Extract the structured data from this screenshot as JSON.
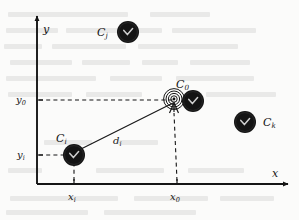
{
  "figure": {
    "type": "diagram",
    "background_color": "#fbfbfa",
    "ink_color": "#151515"
  },
  "axes": {
    "x_label": "x",
    "y_label": "y",
    "origin": {
      "px": 37,
      "py": 184
    },
    "x_ticks": [
      {
        "label": "x",
        "sub": "i",
        "px": 74
      },
      {
        "label": "x",
        "sub": "0",
        "px": 177
      }
    ],
    "y_ticks": [
      {
        "label": "y",
        "sub": "0",
        "py": 100
      },
      {
        "label": "y",
        "sub": "i",
        "py": 155
      }
    ]
  },
  "nodes": [
    {
      "id": "Cj",
      "label": "C",
      "sub": "j",
      "icon": "sensor-node-icon",
      "cx": 128,
      "cy": 32,
      "r": 11,
      "label_px": 97,
      "label_py": 27
    },
    {
      "id": "C0",
      "label": "C",
      "sub": "0",
      "icon": "sensor-node-icon",
      "cx": 193,
      "cy": 101,
      "r": 11,
      "label_px": 176,
      "label_py": 79,
      "has_antenna": true,
      "antenna_px": 174,
      "antenna_py": 101
    },
    {
      "id": "Ci",
      "label": "C",
      "sub": "i",
      "icon": "sensor-node-icon",
      "cx": 74,
      "cy": 155,
      "r": 11,
      "label_px": 56,
      "label_py": 133
    },
    {
      "id": "Ck",
      "label": "C",
      "sub": "k",
      "icon": "sensor-node-icon",
      "cx": 245,
      "cy": 122,
      "r": 11,
      "label_px": 263,
      "label_py": 117
    }
  ],
  "distance": {
    "label": "d",
    "sub": "i",
    "from": "Ci",
    "to": "C0",
    "label_px": 113,
    "label_py": 136
  },
  "bleed_text_lines": [
    {
      "x": 8,
      "y": 12,
      "w": 120
    },
    {
      "x": 150,
      "y": 12,
      "w": 60
    },
    {
      "x": 6,
      "y": 28,
      "w": 52
    },
    {
      "x": 66,
      "y": 28,
      "w": 96
    },
    {
      "x": 172,
      "y": 28,
      "w": 84
    },
    {
      "x": 4,
      "y": 44,
      "w": 38
    },
    {
      "x": 52,
      "y": 44,
      "w": 74
    },
    {
      "x": 138,
      "y": 44,
      "w": 100
    },
    {
      "x": 10,
      "y": 60,
      "w": 62
    },
    {
      "x": 82,
      "y": 60,
      "w": 48
    },
    {
      "x": 142,
      "y": 60,
      "w": 36
    },
    {
      "x": 190,
      "y": 60,
      "w": 60
    },
    {
      "x": 6,
      "y": 76,
      "w": 90
    },
    {
      "x": 110,
      "y": 76,
      "w": 52
    },
    {
      "x": 176,
      "y": 76,
      "w": 78
    },
    {
      "x": 8,
      "y": 92,
      "w": 64
    },
    {
      "x": 86,
      "y": 92,
      "w": 56
    },
    {
      "x": 206,
      "y": 92,
      "w": 70
    },
    {
      "x": 44,
      "y": 140,
      "w": 48
    },
    {
      "x": 118,
      "y": 140,
      "w": 40
    },
    {
      "x": 8,
      "y": 168,
      "w": 34
    },
    {
      "x": 96,
      "y": 168,
      "w": 68
    },
    {
      "x": 188,
      "y": 168,
      "w": 56
    },
    {
      "x": 10,
      "y": 196,
      "w": 108
    },
    {
      "x": 134,
      "y": 196,
      "w": 74
    },
    {
      "x": 220,
      "y": 196,
      "w": 54
    },
    {
      "x": 6,
      "y": 210,
      "w": 82
    },
    {
      "x": 104,
      "y": 210,
      "w": 92
    }
  ]
}
